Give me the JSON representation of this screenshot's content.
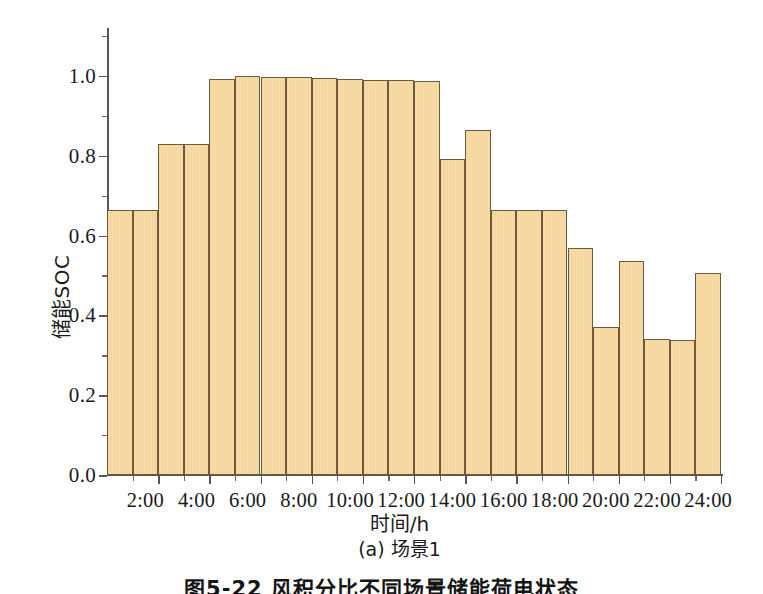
{
  "chart_data": {
    "type": "bar",
    "title": "",
    "subcaption": "(a) 场景1",
    "figure_caption": "图5-22  风积分比不同场景储能荷电状态",
    "xlabel": "时间/h",
    "ylabel": "储能SOC",
    "categories": [
      "1:00",
      "2:00",
      "3:00",
      "4:00",
      "5:00",
      "6:00",
      "7:00",
      "8:00",
      "9:00",
      "10:00",
      "11:00",
      "12:00",
      "13:00",
      "14:00",
      "15:00",
      "16:00",
      "17:00",
      "18:00",
      "19:00",
      "20:00",
      "21:00",
      "22:00",
      "23:00",
      "24:00"
    ],
    "values": [
      0.665,
      0.665,
      0.83,
      0.83,
      0.993,
      1.0,
      0.998,
      0.997,
      0.994,
      0.993,
      0.991,
      0.99,
      0.988,
      0.791,
      0.865,
      0.665,
      0.665,
      0.664,
      0.568,
      0.37,
      0.535,
      0.34,
      0.339,
      0.505
    ],
    "xlim": [
      0,
      24
    ],
    "ylim": [
      0.0,
      1.12
    ],
    "ytick_values": [
      0.0,
      0.2,
      0.4,
      0.6,
      0.8,
      1.0
    ],
    "ytick_labels": [
      "0.0",
      "0.2",
      "0.4",
      "0.6",
      "0.8",
      "1.0"
    ],
    "ytick_minor_values": [
      0.1,
      0.3,
      0.5,
      0.7,
      0.9,
      1.1
    ],
    "xtick_values": [
      2,
      4,
      6,
      8,
      10,
      12,
      14,
      16,
      18,
      20,
      22,
      24
    ],
    "xtick_labels": [
      "2:00",
      "4:00",
      "6:00",
      "8:00",
      "10:00",
      "12:00",
      "14:00",
      "16:00",
      "18:00",
      "20:00",
      "22:00",
      "24:00"
    ],
    "xtick_minor_values": [
      1,
      3,
      5,
      7,
      9,
      11,
      13,
      15,
      17,
      19,
      21,
      23
    ],
    "grid": false,
    "legend": null,
    "bar_fill_color": "#f7d9a4",
    "bar_edge_color": "#6e5a3c",
    "axis_color": "#555555",
    "background_color": "#ffffff"
  }
}
